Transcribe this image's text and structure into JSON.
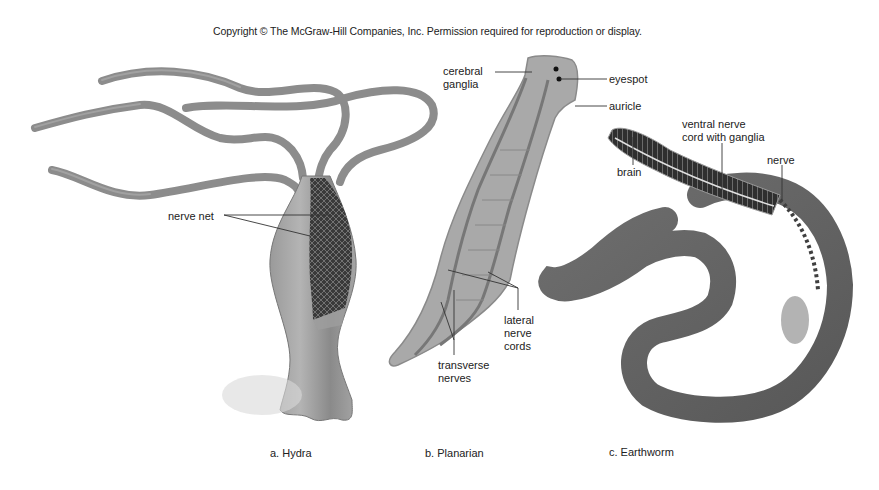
{
  "copyright": "Copyright © The McGraw-Hill Companies, Inc. Permission required for reproduction or display.",
  "panels": [
    {
      "id": "a",
      "caption": "a. Hydra",
      "labels": {
        "nerve_net": "nerve net"
      }
    },
    {
      "id": "b",
      "caption": "b. Planarian",
      "labels": {
        "cerebral_ganglia_1": "cerebral",
        "cerebral_ganglia_2": "ganglia",
        "eyespot": "eyespot",
        "auricle": "auricle",
        "lateral_nerve_cords_1": "lateral",
        "lateral_nerve_cords_2": "nerve",
        "lateral_nerve_cords_3": "cords",
        "transverse_nerves_1": "transverse",
        "transverse_nerves_2": "nerves"
      }
    },
    {
      "id": "c",
      "caption": "c. Earthworm",
      "labels": {
        "ventral_nerve_cord_1": "ventral nerve",
        "ventral_nerve_cord_2": "cord with ganglia",
        "nerve": "nerve",
        "brain": "brain"
      }
    }
  ]
}
